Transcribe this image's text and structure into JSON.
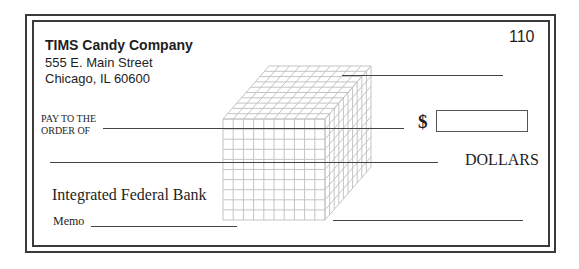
{
  "check": {
    "company": {
      "name": "TIMS Candy Company",
      "address_line1": "555 E. Main Street",
      "address_line2": "Chicago, IL 60600"
    },
    "check_number": "110",
    "pay_to_line1": "PAY TO THE",
    "pay_to_line2": "ORDER OF",
    "currency_symbol": "$",
    "amount_value": "",
    "dollars_label": "DOLLARS",
    "bank_name": "Integrated Federal Bank",
    "memo_label": "Memo",
    "fields": {
      "date": "",
      "payee": "",
      "amount_words": "",
      "memo": "",
      "signature": ""
    }
  },
  "illustration": {
    "name": "base-ten-thousand-cube",
    "grid_units": 10,
    "line_color": "#c4c4c4"
  },
  "colors": {
    "border": "#3a3a3a",
    "text": "#1e1e1e",
    "background": "#ffffff"
  }
}
